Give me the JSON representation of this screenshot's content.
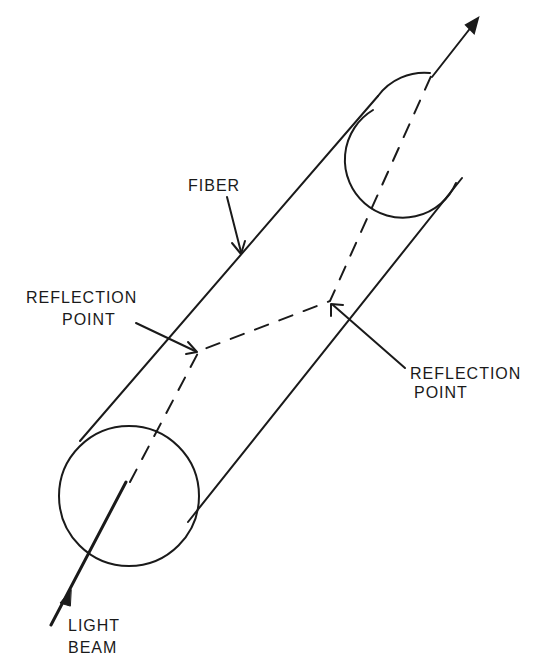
{
  "diagram": {
    "labels": {
      "fiber": "FIBER",
      "reflection_point_left_line1": "REFLECTION",
      "reflection_point_left_line2": "POINT",
      "reflection_point_right_line1": "REFLECTION",
      "reflection_point_right_line2": "POINT",
      "light_beam_line1": "LIGHT",
      "light_beam_line2": "BEAM"
    },
    "colors": {
      "stroke": "#1a1a1a",
      "background": "#ffffff"
    }
  }
}
